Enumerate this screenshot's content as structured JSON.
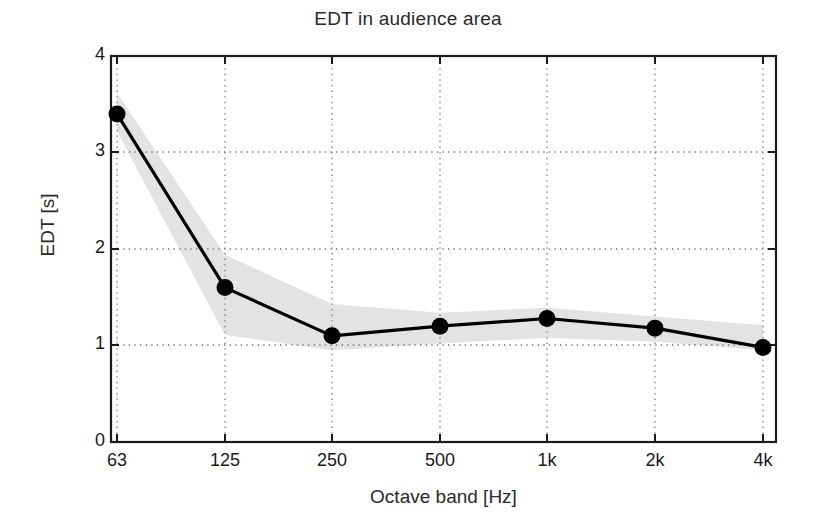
{
  "chart_data": {
    "type": "line",
    "title": "EDT in audience area",
    "xlabel": "Octave band [Hz]",
    "ylabel": "EDT [s]",
    "categories": [
      "63",
      "125",
      "250",
      "500",
      "1k",
      "2k",
      "4k"
    ],
    "series": [
      {
        "name": "EDT mean",
        "values": [
          3.4,
          1.6,
          1.1,
          1.2,
          1.28,
          1.18,
          0.98
        ]
      }
    ],
    "band": {
      "name": "spread",
      "upper": [
        3.62,
        1.94,
        1.43,
        1.34,
        1.39,
        1.3,
        1.21
      ],
      "lower": [
        3.22,
        1.11,
        0.95,
        1.02,
        1.08,
        1.04,
        0.95
      ],
      "color": "#e3e3e3"
    },
    "xtick_labels": [
      "63",
      "125",
      "250",
      "500",
      "1k",
      "2k",
      "4k"
    ],
    "ytick_labels": [
      "0",
      "1",
      "2",
      "3",
      "4"
    ],
    "ytick_values": [
      0,
      1,
      2,
      3,
      4
    ],
    "ylim": [
      0,
      4
    ],
    "grid": true,
    "grid_style": "dotted",
    "legend": "none",
    "line_color": "#000000",
    "marker": "circle",
    "marker_color": "#000000"
  },
  "axes": {
    "x_ticks": [
      {
        "label": "63",
        "px": 117
      },
      {
        "label": "125",
        "px": 225
      },
      {
        "label": "250",
        "px": 332
      },
      {
        "label": "500",
        "px": 440
      },
      {
        "label": "1k",
        "px": 547
      },
      {
        "label": "2k",
        "px": 655
      },
      {
        "label": "4k",
        "px": 763
      }
    ],
    "y_ticks": [
      {
        "label": "0",
        "px": 442
      },
      {
        "label": "1",
        "px": 345
      },
      {
        "label": "2",
        "px": 249
      },
      {
        "label": "3",
        "px": 152
      },
      {
        "label": "4",
        "px": 56
      }
    ]
  }
}
